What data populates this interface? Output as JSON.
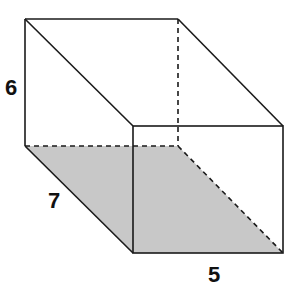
{
  "diagram": {
    "type": "rectangular-prism",
    "colors": {
      "stroke": "#1a1a1a",
      "shade": "#c8c8c8",
      "background": "#ffffff"
    },
    "labels": {
      "height": "6",
      "depth": "7",
      "width": "5"
    },
    "shaded_face": "base"
  }
}
